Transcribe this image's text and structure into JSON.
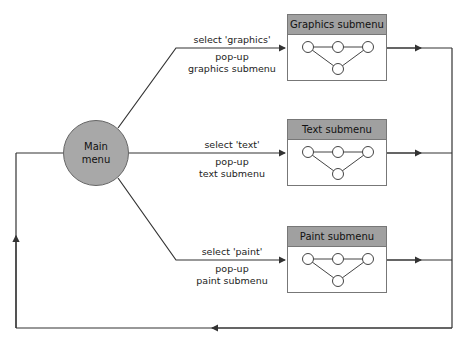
{
  "diagram": {
    "main_node": {
      "line1": "Main",
      "line2": "menu",
      "fill": "#a8a8a8"
    },
    "submenus": [
      {
        "title": "Graphics submenu",
        "transition_event": "select 'graphics'",
        "action_line1": "pop-up",
        "action_line2": "graphics submenu"
      },
      {
        "title": "Text submenu",
        "transition_event": "select 'text'",
        "action_line1": "pop-up",
        "action_line2": "text submenu"
      },
      {
        "title": "Paint submenu",
        "transition_event": "select 'paint'",
        "action_line1": "pop-up",
        "action_line2": "paint submenu"
      }
    ],
    "header_fill": "#a0a0a0",
    "line_color": "#333333"
  }
}
